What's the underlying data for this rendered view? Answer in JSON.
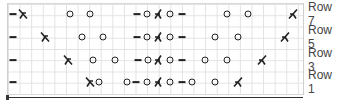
{
  "chart": {
    "rows": [
      {
        "label": "Row 7",
        "y": 14,
        "stitches": [
          {
            "type": "purl",
            "x": 13
          },
          {
            "type": "ssk",
            "x": 23
          },
          {
            "type": "yo",
            "x": 70
          },
          {
            "type": "yo",
            "x": 90
          },
          {
            "type": "purl",
            "x": 137
          },
          {
            "type": "yo",
            "x": 147
          },
          {
            "type": "cdd",
            "x": 158
          },
          {
            "type": "yo",
            "x": 170
          },
          {
            "type": "purl",
            "x": 182
          },
          {
            "type": "yo",
            "x": 227
          },
          {
            "type": "yo",
            "x": 248
          },
          {
            "type": "k2tog",
            "x": 293
          }
        ]
      },
      {
        "label": "Row 5",
        "y": 37,
        "stitches": [
          {
            "type": "purl",
            "x": 13
          },
          {
            "type": "ssk",
            "x": 45
          },
          {
            "type": "yo",
            "x": 82
          },
          {
            "type": "yo",
            "x": 103
          },
          {
            "type": "purl",
            "x": 137
          },
          {
            "type": "yo",
            "x": 147
          },
          {
            "type": "cdd",
            "x": 158
          },
          {
            "type": "yo",
            "x": 170
          },
          {
            "type": "purl",
            "x": 182
          },
          {
            "type": "yo",
            "x": 215
          },
          {
            "type": "yo",
            "x": 238
          },
          {
            "type": "k2tog",
            "x": 285
          }
        ]
      },
      {
        "label": "Row 3",
        "y": 60,
        "stitches": [
          {
            "type": "purl",
            "x": 13
          },
          {
            "type": "ssk",
            "x": 68
          },
          {
            "type": "yo",
            "x": 93
          },
          {
            "type": "yo",
            "x": 115
          },
          {
            "type": "purl",
            "x": 138
          },
          {
            "type": "yo",
            "x": 148
          },
          {
            "type": "cdd",
            "x": 158
          },
          {
            "type": "yo",
            "x": 170
          },
          {
            "type": "purl",
            "x": 182
          },
          {
            "type": "yo",
            "x": 205
          },
          {
            "type": "yo",
            "x": 227
          },
          {
            "type": "k2tog",
            "x": 262
          }
        ]
      },
      {
        "label": "Row 1",
        "y": 82,
        "stitches": [
          {
            "type": "purl",
            "x": 13
          },
          {
            "type": "ssk",
            "x": 90
          },
          {
            "type": "yo",
            "x": 99
          },
          {
            "type": "yo",
            "x": 127
          },
          {
            "type": "purl",
            "x": 136
          },
          {
            "type": "yo",
            "x": 147
          },
          {
            "type": "cdd",
            "x": 158
          },
          {
            "type": "yo",
            "x": 170
          },
          {
            "type": "purl",
            "x": 182
          },
          {
            "type": "yo",
            "x": 192
          },
          {
            "type": "yo",
            "x": 215
          },
          {
            "type": "k2tog",
            "x": 238
          }
        ]
      }
    ],
    "symbol_legend": {
      "purl": "purl-dash-icon",
      "yo": "yarn-over-circle-icon",
      "ssk": "left-leaning-decrease-icon",
      "k2tog": "right-leaning-decrease-icon",
      "cdd": "central-double-decrease-icon"
    },
    "colors": {
      "ink": "#222222",
      "grid": "#e2e2e2",
      "label": "#444444"
    }
  }
}
